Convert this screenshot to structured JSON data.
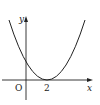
{
  "diagram": {
    "type": "function-graph",
    "axes": {
      "x_label": "x",
      "y_label": "y",
      "origin_label": "O"
    },
    "ticks": {
      "x": [
        "2"
      ]
    },
    "curve": {
      "kind": "parabola",
      "vertex_x_label": "2",
      "opens": "up",
      "touches_x_axis_at": "2"
    },
    "colors": {
      "stroke": "#222222",
      "background": "#ffffff"
    }
  }
}
